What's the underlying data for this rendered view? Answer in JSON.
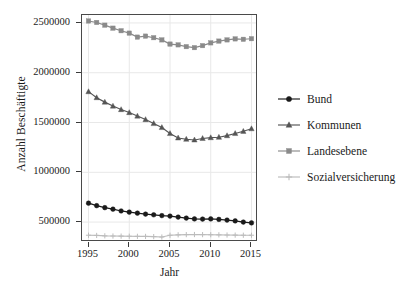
{
  "chart_data": {
    "type": "line",
    "title": "",
    "xlabel": "Jahr",
    "ylabel": "Anzahl Beschäftigte",
    "xlim": [
      1994.2,
      2015.8
    ],
    "ylim": [
      300000,
      2580000
    ],
    "xticks": [
      1995,
      2000,
      2005,
      2010,
      2015
    ],
    "xtick_labels": [
      "1995",
      "2000",
      "2005",
      "2010",
      "2015"
    ],
    "yticks": [
      500000,
      1000000,
      1500000,
      2000000,
      2500000
    ],
    "ytick_labels": [
      "500000",
      "1000000",
      "1500000",
      "2000000",
      "2500000"
    ],
    "grid": true,
    "legend_position": "right",
    "x": [
      1995,
      1996,
      1997,
      1998,
      1999,
      2000,
      2001,
      2002,
      2003,
      2004,
      2005,
      2006,
      2007,
      2008,
      2009,
      2010,
      2011,
      2012,
      2013,
      2014,
      2015
    ],
    "series": [
      {
        "name": "Bund",
        "marker": "circle",
        "color": "#1a1a1a",
        "values": [
          690000,
          665000,
          645000,
          630000,
          612000,
          600000,
          590000,
          580000,
          573000,
          565000,
          560000,
          550000,
          540000,
          532000,
          530000,
          532000,
          527000,
          520000,
          512000,
          500000,
          492000
        ]
      },
      {
        "name": "Kommunen",
        "marker": "triangle",
        "color": "#555555",
        "values": [
          1810000,
          1750000,
          1705000,
          1665000,
          1630000,
          1600000,
          1565000,
          1530000,
          1490000,
          1450000,
          1390000,
          1345000,
          1332000,
          1325000,
          1340000,
          1348000,
          1352000,
          1368000,
          1390000,
          1412000,
          1438000
        ]
      },
      {
        "name": "Landesebene",
        "marker": "square",
        "color": "#8a8a8a",
        "values": [
          2520000,
          2505000,
          2478000,
          2448000,
          2422000,
          2398000,
          2358000,
          2368000,
          2352000,
          2330000,
          2288000,
          2280000,
          2262000,
          2252000,
          2272000,
          2300000,
          2318000,
          2330000,
          2340000,
          2336000,
          2342000
        ]
      },
      {
        "name": "Sozialversicherung",
        "marker": "plus",
        "color": "#bcbcbc",
        "values": [
          368000,
          366000,
          362000,
          360000,
          359000,
          358000,
          357000,
          356000,
          354000,
          350000,
          368000,
          372000,
          374000,
          375000,
          374000,
          373000,
          372000,
          370000,
          369000,
          368000,
          368000
        ]
      }
    ]
  },
  "legend": {
    "items": [
      {
        "label": "Bund"
      },
      {
        "label": "Kommunen"
      },
      {
        "label": "Landesebene"
      },
      {
        "label": "Sozialversicherung"
      }
    ]
  },
  "colors": {
    "bund": "#1a1a1a",
    "kommunen": "#555555",
    "landesebene": "#8a8a8a",
    "sozialversicherung": "#bcbcbc",
    "panel_border": "#4a4a4a",
    "grid": "#e8e8e8",
    "text": "#1a1a1a"
  }
}
